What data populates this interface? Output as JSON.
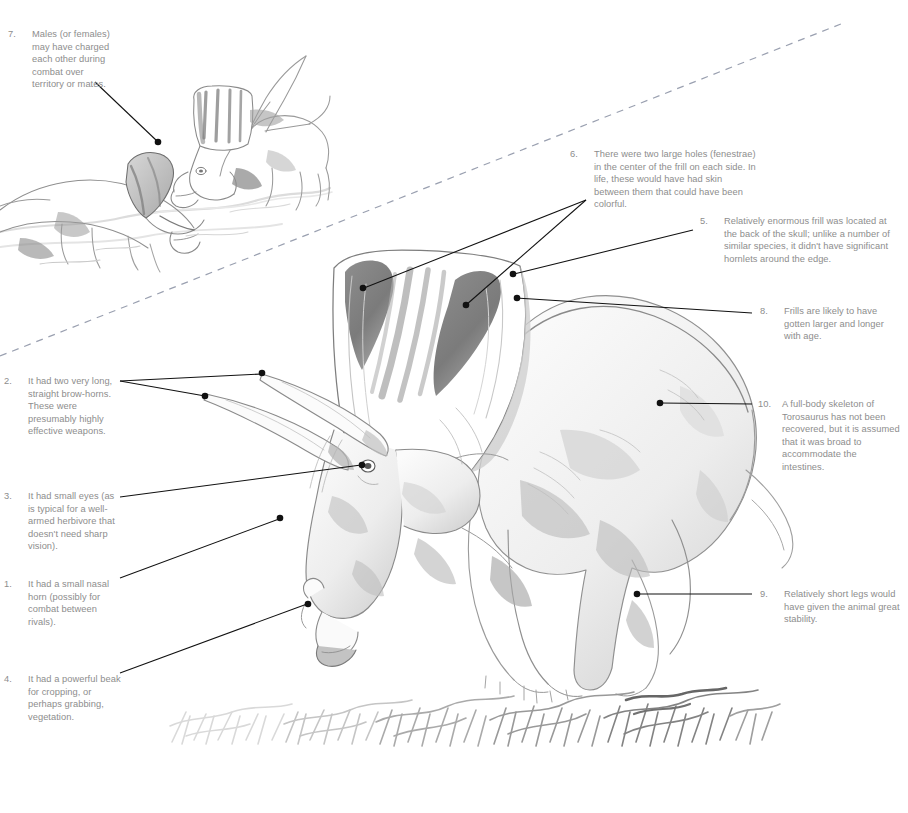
{
  "diagram": {
    "subject": "Torosaurus",
    "style": "pencil-sketch-grayscale",
    "text_color": "#8d8d8d",
    "leader_color": "#111111",
    "divider_color": "#9aa0b0"
  },
  "callouts": [
    {
      "number": "7.",
      "text": "Males (or females) may have charged each other during combat over territory or mates.",
      "align": "left"
    },
    {
      "number": "6.",
      "text": "There were two large holes (fenestrae) in the center of the frill on each side. In life, these would have had skin between them that could have been colorful.",
      "align": "left"
    },
    {
      "number": "5.",
      "text": "Relatively enormous frill was located at the back of the skull; unlike a number of similar species, it didn't have significant hornlets around the edge.",
      "align": "left"
    },
    {
      "number": "8.",
      "text": "Frills are likely to have gotten larger and longer with age.",
      "align": "left"
    },
    {
      "number": "2.",
      "text": "It had two very long, straight brow-horns. These were presumably highly effective weapons.",
      "align": "left"
    },
    {
      "number": "10.",
      "text": "A full-body skeleton of Torosaurus has not been recovered, but it is assumed that it was broad to accommodate the intestines.",
      "align": "left"
    },
    {
      "number": "3.",
      "text": "It had small eyes (as is typical for a well-armed herbivore that doesn't need sharp vision).",
      "align": "left"
    },
    {
      "number": "1.",
      "text": "It had a small nasal horn (possibly for combat between rivals).",
      "align": "left"
    },
    {
      "number": "9.",
      "text": "Relatively short legs would have given the animal great stability.",
      "align": "left"
    },
    {
      "number": "4.",
      "text": "It had a powerful beak for cropping, or perhaps grabbing, vegetation.",
      "align": "left"
    }
  ],
  "illustrations": {
    "inset_label": "two-torosaurus-charging-sketch",
    "main_label": "torosaurus-body-sketch",
    "ground_label": "grass-tufts-sketch"
  }
}
